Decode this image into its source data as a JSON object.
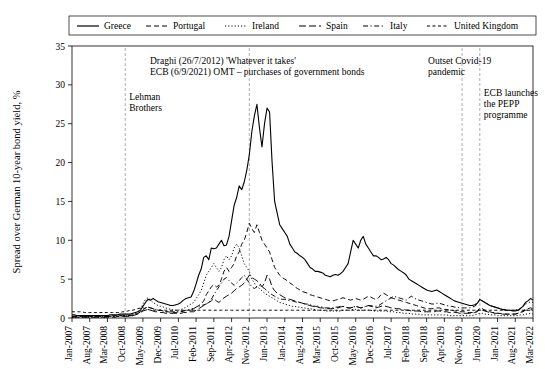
{
  "chart_data": {
    "type": "line",
    "title": "",
    "xlabel": "",
    "ylabel": "Spread over German 10-year bond yield, %",
    "ylim": [
      0,
      35
    ],
    "yticks": [
      0,
      5,
      10,
      15,
      20,
      25,
      30,
      35
    ],
    "grid": false,
    "legend_position": "top",
    "legend": [
      {
        "name": "Greece",
        "style": "solid"
      },
      {
        "name": "Portugal",
        "style": "dashed"
      },
      {
        "name": "Ireland",
        "style": "dotted"
      },
      {
        "name": "Spain",
        "style": "dash-long"
      },
      {
        "name": "Italy",
        "style": "dash-dot"
      },
      {
        "name": "United Kingdom",
        "style": "dash-short"
      }
    ],
    "xticks": [
      "Jan-2007",
      "Aug-2007",
      "Mar-2008",
      "Oct-2008",
      "May-2009",
      "Dec-2009",
      "Jul-2010",
      "Feb-2011",
      "Sep-2011",
      "Apr-2012",
      "Nov-2012",
      "Jun-2013",
      "Jan-2014",
      "Aug-2014",
      "Mar-2015",
      "Oct-2015",
      "May-2016",
      "Dec-2016",
      "Jul-2017",
      "Feb-2018",
      "Sep-2018",
      "Apr-2019",
      "Nov-2019",
      "Jun-2020",
      "Jan-2021",
      "Aug-2021",
      "Mar-2022"
    ],
    "annotations": [
      {
        "id": "lehman",
        "lines": [
          "Lehman",
          "Brothers"
        ],
        "x_label": "Oct-2008"
      },
      {
        "id": "draghi",
        "lines": [
          "Draghi (26/7/2012) 'Whatever it takes'",
          "ECB (6/9/2021) OMT – purchases of government bonds"
        ],
        "x_label": "Nov-2012"
      },
      {
        "id": "covid",
        "lines": [
          "Outset Covid-19",
          "pandemic"
        ],
        "x_label": "Nov-2019"
      },
      {
        "id": "pepp",
        "lines": [
          "ECB launches",
          "the PEPP",
          "programme"
        ],
        "x_label": "Jun-2020"
      }
    ],
    "series": [
      {
        "name": "Greece",
        "style": "solid",
        "values": [
          0.4,
          0.4,
          0.3,
          0.3,
          0.3,
          0.3,
          0.3,
          0.3,
          0.3,
          0.3,
          0.3,
          0.3,
          0.3,
          0.3,
          0.3,
          0.4,
          0.4,
          0.4,
          0.4,
          0.5,
          0.5,
          0.5,
          0.5,
          0.5,
          0.6,
          0.7,
          0.8,
          1.0,
          1.5,
          2.0,
          2.4,
          2.3,
          2.5,
          2.3,
          2.1,
          2.0,
          1.9,
          1.8,
          1.7,
          1.6,
          1.6,
          1.7,
          1.8,
          2.0,
          2.3,
          2.5,
          2.6,
          2.7,
          3.4,
          4.4,
          5.5,
          6.3,
          7.8,
          8.0,
          7.5,
          9.0,
          8.9,
          9.0,
          9.5,
          10.0,
          9.3,
          9.4,
          10.5,
          12.5,
          14.5,
          15.5,
          17.0,
          16.5,
          17.5,
          19.0,
          21.0,
          24.0,
          26.0,
          27.5,
          24.5,
          22.0,
          25.0,
          27.0,
          26.5,
          20.0,
          15.0,
          13.5,
          12.0,
          11.5,
          11.0,
          10.5,
          9.5,
          9.0,
          8.5,
          8.3,
          8.0,
          7.8,
          7.5,
          7.0,
          6.5,
          6.3,
          6.0,
          6.0,
          5.9,
          5.8,
          5.5,
          5.4,
          5.3,
          5.5,
          5.6,
          5.5,
          5.7,
          6.0,
          6.5,
          7.0,
          8.5,
          10.0,
          9.5,
          9.0,
          10.0,
          10.5,
          9.5,
          9.0,
          8.5,
          8.0,
          8.0,
          7.8,
          7.5,
          7.6,
          7.8,
          7.5,
          7.0,
          6.8,
          6.5,
          6.2,
          6.0,
          5.8,
          5.5,
          5.0,
          4.8,
          4.6,
          4.4,
          4.2,
          4.0,
          3.8,
          3.6,
          3.5,
          3.4,
          3.5,
          3.6,
          3.4,
          3.2,
          3.0,
          2.8,
          2.6,
          2.4,
          2.2,
          2.1,
          2.0,
          1.9,
          1.8,
          1.7,
          1.6,
          1.6,
          1.7,
          1.9,
          2.4,
          2.2,
          2.0,
          1.8,
          1.6,
          1.5,
          1.4,
          1.3,
          1.2,
          1.1,
          1.0,
          1.0,
          1.0,
          0.9,
          0.9,
          1.0,
          1.2,
          1.5,
          2.0,
          2.2,
          2.5,
          2.3
        ]
      },
      {
        "name": "Portugal",
        "style": "dashed",
        "values": [
          0.2,
          0.2,
          0.2,
          0.2,
          0.2,
          0.2,
          0.2,
          0.2,
          0.2,
          0.2,
          0.2,
          0.2,
          0.2,
          0.2,
          0.2,
          0.2,
          0.3,
          0.3,
          0.3,
          0.3,
          0.3,
          0.3,
          0.3,
          0.3,
          0.4,
          0.5,
          0.6,
          0.8,
          1.0,
          1.3,
          1.4,
          1.3,
          1.2,
          1.1,
          1.0,
          1.0,
          0.9,
          0.8,
          0.8,
          0.7,
          0.7,
          0.7,
          0.8,
          0.8,
          0.9,
          1.0,
          1.0,
          1.0,
          1.2,
          1.4,
          1.6,
          1.8,
          2.2,
          3.0,
          3.5,
          4.0,
          4.3,
          4.0,
          4.2,
          5.0,
          6.0,
          6.5,
          6.0,
          6.5,
          7.0,
          8.0,
          8.5,
          9.5,
          10.0,
          11.0,
          12.2,
          11.5,
          11.0,
          12.0,
          11.0,
          10.0,
          9.5,
          9.0,
          8.5,
          7.5,
          6.5,
          6.0,
          5.5,
          5.2,
          5.0,
          4.8,
          4.5,
          4.3,
          4.0,
          3.8,
          3.6,
          3.4,
          3.3,
          3.2,
          3.0,
          2.9,
          2.8,
          2.7,
          2.6,
          2.5,
          2.4,
          2.3,
          2.2,
          2.2,
          2.3,
          2.4,
          2.5,
          2.6,
          2.5,
          2.4,
          2.3,
          2.4,
          2.5,
          2.4,
          2.3,
          2.4,
          2.6,
          2.8,
          2.7,
          2.5,
          2.4,
          2.6,
          3.0,
          3.2,
          3.0,
          2.8,
          2.6,
          2.5,
          2.4,
          2.3,
          2.2,
          2.1,
          2.0,
          1.9,
          1.8,
          1.7,
          1.6,
          1.5,
          1.4,
          1.3,
          1.2,
          1.2,
          1.2,
          1.2,
          1.3,
          1.3,
          1.2,
          1.1,
          1.1,
          1.0,
          1.0,
          0.9,
          0.9,
          0.8,
          0.8,
          0.8,
          0.7,
          0.7,
          0.7,
          0.8,
          0.9,
          1.3,
          1.2,
          1.0,
          0.9,
          0.8,
          0.7,
          0.7,
          0.6,
          0.6,
          0.5,
          0.5,
          0.5,
          0.5,
          0.5,
          0.5,
          0.6,
          0.7,
          0.9,
          1.1,
          1.2,
          1.3,
          1.2
        ]
      },
      {
        "name": "Ireland",
        "style": "dotted",
        "values": [
          0.1,
          0.1,
          0.1,
          0.1,
          0.1,
          0.1,
          0.1,
          0.1,
          0.1,
          0.1,
          0.1,
          0.1,
          0.1,
          0.1,
          0.2,
          0.2,
          0.2,
          0.2,
          0.2,
          0.3,
          0.3,
          0.3,
          0.3,
          0.3,
          0.4,
          0.6,
          0.8,
          1.2,
          1.8,
          2.4,
          2.6,
          2.3,
          2.0,
          1.8,
          1.6,
          1.5,
          1.4,
          1.3,
          1.2,
          1.1,
          1.0,
          1.0,
          1.0,
          1.1,
          1.2,
          1.4,
          1.6,
          1.8,
          2.0,
          2.5,
          3.0,
          3.5,
          4.5,
          5.5,
          6.0,
          6.5,
          7.0,
          6.5,
          6.0,
          6.5,
          7.5,
          8.0,
          7.5,
          8.0,
          9.0,
          9.5,
          9.0,
          8.0,
          7.0,
          6.5,
          6.0,
          5.0,
          4.5,
          4.0,
          3.8,
          3.5,
          3.2,
          3.0,
          2.8,
          2.6,
          2.4,
          2.2,
          2.0,
          1.9,
          1.8,
          1.7,
          1.6,
          1.5,
          1.5,
          1.4,
          1.4,
          1.3,
          1.3,
          1.2,
          1.2,
          1.1,
          1.1,
          1.0,
          1.0,
          1.0,
          0.9,
          0.9,
          0.9,
          0.9,
          0.9,
          0.9,
          0.9,
          1.0,
          1.0,
          1.0,
          1.0,
          1.1,
          1.1,
          1.0,
          1.0,
          1.0,
          1.0,
          1.0,
          1.0,
          0.9,
          0.9,
          0.9,
          0.9,
          0.9,
          0.9,
          0.8,
          0.8,
          0.8,
          0.7,
          0.7,
          0.7,
          0.6,
          0.6,
          0.6,
          0.5,
          0.5,
          0.5,
          0.5,
          0.4,
          0.4,
          0.4,
          0.4,
          0.4,
          0.4,
          0.4,
          0.4,
          0.4,
          0.4,
          0.4,
          0.3,
          0.3,
          0.3,
          0.3,
          0.3,
          0.3,
          0.3,
          0.3,
          0.3,
          0.3,
          0.4,
          0.5,
          0.6,
          0.6,
          0.5,
          0.5,
          0.4,
          0.4,
          0.4,
          0.3,
          0.3,
          0.3,
          0.3,
          0.3,
          0.3,
          0.3,
          0.3,
          0.3,
          0.4,
          0.4,
          0.5,
          0.5,
          0.6,
          0.5
        ]
      },
      {
        "name": "Spain",
        "style": "dash-long",
        "values": [
          0.1,
          0.1,
          0.1,
          0.1,
          0.1,
          0.1,
          0.1,
          0.1,
          0.1,
          0.1,
          0.1,
          0.1,
          0.1,
          0.1,
          0.1,
          0.1,
          0.1,
          0.1,
          0.2,
          0.2,
          0.2,
          0.2,
          0.2,
          0.2,
          0.3,
          0.4,
          0.5,
          0.7,
          0.9,
          1.0,
          1.1,
          1.0,
          0.9,
          0.8,
          0.8,
          0.7,
          0.7,
          0.6,
          0.6,
          0.6,
          0.6,
          0.6,
          0.6,
          0.6,
          0.7,
          0.7,
          0.8,
          0.8,
          0.8,
          1.0,
          1.2,
          1.4,
          1.6,
          1.8,
          2.0,
          2.2,
          2.5,
          2.2,
          2.0,
          2.3,
          2.6,
          2.8,
          3.0,
          3.2,
          3.5,
          3.8,
          4.0,
          4.2,
          4.5,
          5.0,
          5.5,
          5.2,
          5.0,
          4.8,
          4.5,
          4.0,
          4.5,
          5.5,
          5.0,
          4.0,
          3.5,
          3.2,
          3.0,
          2.8,
          2.6,
          2.5,
          2.4,
          2.3,
          2.2,
          2.1,
          2.0,
          1.9,
          1.8,
          1.7,
          1.6,
          1.5,
          1.4,
          1.4,
          1.3,
          1.3,
          1.2,
          1.2,
          1.2,
          1.2,
          1.3,
          1.3,
          1.4,
          1.5,
          1.4,
          1.3,
          1.3,
          1.4,
          1.5,
          1.4,
          1.3,
          1.4,
          1.5,
          1.6,
          1.5,
          1.4,
          1.3,
          1.4,
          1.5,
          1.6,
          1.5,
          1.4,
          1.3,
          1.3,
          1.2,
          1.2,
          1.1,
          1.1,
          1.0,
          1.0,
          0.9,
          0.9,
          0.9,
          0.9,
          0.8,
          0.8,
          0.8,
          0.8,
          0.8,
          0.8,
          0.9,
          0.9,
          0.8,
          0.8,
          0.8,
          0.7,
          0.7,
          0.7,
          0.7,
          0.6,
          0.6,
          0.6,
          0.6,
          0.6,
          0.6,
          0.7,
          0.8,
          1.1,
          1.0,
          0.9,
          0.8,
          0.7,
          0.7,
          0.6,
          0.6,
          0.6,
          0.5,
          0.5,
          0.5,
          0.5,
          0.5,
          0.5,
          0.6,
          0.7,
          0.8,
          1.0,
          1.0,
          1.1,
          1.0
        ]
      },
      {
        "name": "Italy",
        "style": "dash-dot",
        "values": [
          0.2,
          0.2,
          0.2,
          0.2,
          0.2,
          0.2,
          0.2,
          0.2,
          0.2,
          0.2,
          0.2,
          0.2,
          0.2,
          0.2,
          0.2,
          0.2,
          0.2,
          0.2,
          0.2,
          0.3,
          0.3,
          0.3,
          0.3,
          0.3,
          0.4,
          0.5,
          0.6,
          0.8,
          1.0,
          1.3,
          1.4,
          1.3,
          1.2,
          1.1,
          1.0,
          1.0,
          0.9,
          0.8,
          0.8,
          0.8,
          0.8,
          0.8,
          0.8,
          0.8,
          0.9,
          1.0,
          1.1,
          1.2,
          1.2,
          1.4,
          1.5,
          1.6,
          1.7,
          1.8,
          2.0,
          2.4,
          3.0,
          3.5,
          4.0,
          4.5,
          5.0,
          5.2,
          4.8,
          4.5,
          4.2,
          4.5,
          4.8,
          5.2,
          5.5,
          5.0,
          4.5,
          4.0,
          3.8,
          4.0,
          4.2,
          4.0,
          3.8,
          3.5,
          3.2,
          3.0,
          2.8,
          2.6,
          2.5,
          2.4,
          2.4,
          2.3,
          2.2,
          2.2,
          2.1,
          2.0,
          2.0,
          1.9,
          1.8,
          1.8,
          1.7,
          1.6,
          1.5,
          1.5,
          1.4,
          1.4,
          1.3,
          1.3,
          1.3,
          1.3,
          1.4,
          1.4,
          1.5,
          1.5,
          1.4,
          1.3,
          1.3,
          1.4,
          1.5,
          1.4,
          1.3,
          1.4,
          1.5,
          1.6,
          1.6,
          1.5,
          1.5,
          1.6,
          1.8,
          2.0,
          2.2,
          2.4,
          2.6,
          2.8,
          2.7,
          2.6,
          2.5,
          2.4,
          2.3,
          2.6,
          2.8,
          2.6,
          2.4,
          2.3,
          2.2,
          2.1,
          2.0,
          1.9,
          1.8,
          1.8,
          1.9,
          1.9,
          1.8,
          1.7,
          1.6,
          1.5,
          1.5,
          1.4,
          1.4,
          1.3,
          1.3,
          1.3,
          1.3,
          1.3,
          1.4,
          1.5,
          1.8,
          2.3,
          2.2,
          2.0,
          1.8,
          1.6,
          1.5,
          1.4,
          1.3,
          1.2,
          1.1,
          1.1,
          1.0,
          1.0,
          1.0,
          1.0,
          1.1,
          1.3,
          1.5,
          1.8,
          1.9,
          2.1,
          2.0
        ]
      },
      {
        "name": "United Kingdom",
        "style": "dash-short",
        "values": [
          0.8,
          0.8,
          0.8,
          0.8,
          0.8,
          0.7,
          0.7,
          0.7,
          0.7,
          0.7,
          0.7,
          0.7,
          0.7,
          0.7,
          0.7,
          0.7,
          0.7,
          0.7,
          0.7,
          0.7,
          0.8,
          0.8,
          0.9,
          1.0,
          1.0,
          1.1,
          1.2,
          1.3,
          1.3,
          1.2,
          1.1,
          1.0,
          1.0,
          1.0,
          1.0,
          1.0,
          1.0,
          1.0,
          1.0,
          1.0,
          1.0,
          1.0,
          1.0,
          1.0,
          1.0,
          1.0,
          1.0,
          1.0,
          1.0,
          1.0,
          1.0,
          1.0,
          1.0,
          1.0,
          1.0,
          1.0,
          1.0,
          1.0,
          1.0,
          1.0,
          1.0,
          1.0,
          1.0,
          1.0,
          1.0,
          1.0,
          1.0,
          1.0,
          1.0,
          1.0,
          1.0,
          1.0,
          1.0,
          1.0,
          1.0,
          1.0,
          1.0,
          1.0,
          1.0,
          1.0,
          1.0,
          1.0,
          1.0,
          1.0,
          1.0,
          1.0,
          1.0,
          1.0,
          1.0,
          1.0,
          1.0,
          1.0,
          1.0,
          1.0,
          1.0,
          1.0,
          1.0,
          1.0,
          1.0,
          1.0,
          1.0,
          1.0,
          1.0,
          1.0,
          1.0,
          1.0,
          1.0,
          1.0,
          1.0,
          1.0,
          1.0,
          1.0,
          1.0,
          1.0,
          1.0,
          1.0,
          1.0,
          1.0,
          1.0,
          1.0,
          1.0,
          1.0,
          1.0,
          1.0,
          1.0,
          1.0,
          1.0,
          1.0,
          1.0,
          1.0,
          1.0,
          1.0,
          1.0,
          1.0,
          1.0,
          1.0,
          1.0,
          1.0,
          1.0,
          1.0,
          1.0,
          1.0,
          1.0,
          1.0,
          1.0,
          1.0,
          1.0,
          1.0,
          1.0,
          1.0,
          1.0,
          1.0,
          1.0,
          1.0,
          1.0,
          1.0,
          1.0,
          1.0,
          1.0,
          1.0,
          1.0,
          1.0,
          1.0,
          1.0,
          1.0,
          1.0,
          1.0,
          1.0,
          1.0,
          1.0,
          1.0,
          1.0,
          1.0,
          1.0,
          1.0,
          1.0,
          1.0,
          1.0,
          1.0,
          1.0,
          1.0,
          1.0,
          1.0
        ]
      }
    ]
  }
}
